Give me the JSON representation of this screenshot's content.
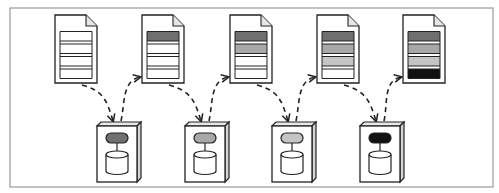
{
  "diagram": {
    "type": "pipeline",
    "frame": {
      "x": 10,
      "y": 8,
      "w": 483,
      "h": 179,
      "stroke": "#9a9a9a"
    },
    "colors": {
      "dark": "#6f6f6f",
      "medium": "#a8a8a8",
      "light": "#c4c4c4",
      "black": "#111111",
      "empty": "#ffffff",
      "line": "#222222"
    },
    "documents": [
      {
        "id": "doc-1",
        "x": 55,
        "rows": [
          "empty",
          "empty",
          "empty",
          "empty"
        ]
      },
      {
        "id": "doc-2",
        "x": 142,
        "rows": [
          "dark",
          "empty",
          "empty",
          "empty"
        ]
      },
      {
        "id": "doc-3",
        "x": 230,
        "rows": [
          "dark",
          "medium",
          "empty",
          "empty"
        ]
      },
      {
        "id": "doc-4",
        "x": 317,
        "rows": [
          "dark",
          "medium",
          "light",
          "empty"
        ]
      },
      {
        "id": "doc-5",
        "x": 403,
        "rows": [
          "dark",
          "medium",
          "light",
          "black"
        ]
      }
    ],
    "servers": [
      {
        "id": "server-1",
        "x": 97,
        "process_color": "dark"
      },
      {
        "id": "server-2",
        "x": 185,
        "process_color": "medium"
      },
      {
        "id": "server-3",
        "x": 272,
        "process_color": "light"
      },
      {
        "id": "server-4",
        "x": 360,
        "process_color": "black"
      }
    ],
    "arrows": [
      {
        "from": "doc-1",
        "to": "server-1",
        "style": "dashed"
      },
      {
        "from": "server-1",
        "to": "doc-2",
        "style": "dashed"
      },
      {
        "from": "doc-2",
        "to": "server-2",
        "style": "dashed"
      },
      {
        "from": "server-2",
        "to": "doc-3",
        "style": "dashed"
      },
      {
        "from": "doc-3",
        "to": "server-3",
        "style": "dashed"
      },
      {
        "from": "server-3",
        "to": "doc-4",
        "style": "dashed"
      },
      {
        "from": "doc-4",
        "to": "server-4",
        "style": "dashed"
      },
      {
        "from": "server-4",
        "to": "doc-5",
        "style": "dashed"
      }
    ]
  }
}
